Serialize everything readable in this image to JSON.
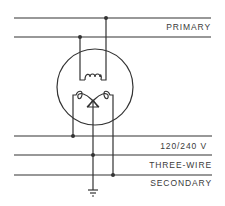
{
  "diagram": {
    "labels": {
      "primary": "PRIMARY",
      "secondary_line1": "120/240 V",
      "secondary_line2": "THREE-WIRE",
      "secondary_line3": "SECONDARY"
    },
    "colors": {
      "line": "#333333",
      "background": "#ffffff",
      "text": "#3a3a3a"
    },
    "components": [
      "primary-conductor-1",
      "primary-conductor-2",
      "transformer-tank",
      "primary-winding",
      "secondary-winding",
      "center-tap",
      "secondary-hot-1",
      "secondary-neutral",
      "secondary-hot-2",
      "ground"
    ]
  }
}
